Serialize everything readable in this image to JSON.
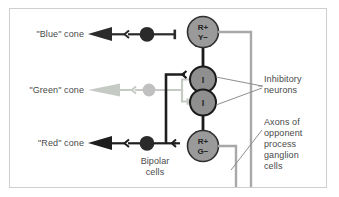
{
  "diagram": {
    "frame": {
      "border_color": "#cfcfcf",
      "background": "#ffffff"
    },
    "colors": {
      "blue_cone_path": "#2b2b2b",
      "green_cone_path": "#c3c7c1",
      "red_cone_path": "#1e1e1e",
      "ganglion_fill": "#9a9a9a",
      "ganglion_stroke": "#2e2e2e",
      "inhibitory_fill": "#8f8f8f",
      "inhibitory_stroke": "#1b1b1b",
      "bipolar_fill": "#2a2a2a",
      "bipolar_green_fill": "#bdbdbd",
      "axon_line": "#a8a8a8",
      "leader_line": "#8e8e8e",
      "text": "#4a4a4a"
    },
    "cones": [
      {
        "id": "blue",
        "label": "\"Blue\" cone"
      },
      {
        "id": "green",
        "label": "\"Green\" cone"
      },
      {
        "id": "red",
        "label": "\"Red\" cone"
      }
    ],
    "ganglion_cells": [
      {
        "id": "ry",
        "line1": "R+",
        "line2": "Y−"
      },
      {
        "id": "rg",
        "line1": "R+",
        "line2": "G−"
      }
    ],
    "inhibitory_neurons": [
      {
        "id": "i-upper",
        "label": "I"
      },
      {
        "id": "i-lower",
        "label": "I"
      }
    ],
    "annotations": {
      "bipolar": "Bipolar\ncells",
      "inhibitory": "Inhibitory\nneurons",
      "axons": "Axons of\nopponent\nprocess\nganglion\ncells"
    }
  }
}
